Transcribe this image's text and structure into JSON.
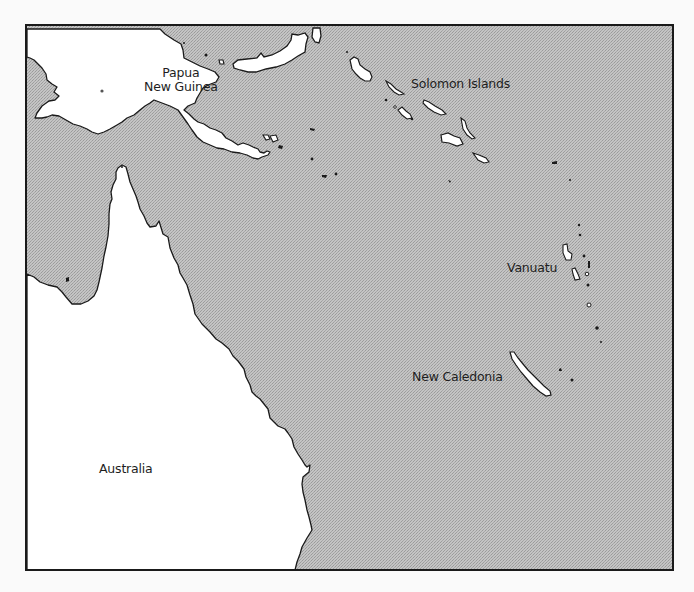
{
  "map": {
    "type": "regional map",
    "colors": {
      "land": "#ffffff",
      "sea": "#bdbdbd",
      "coastline": "#1a1a1a",
      "frame": "#1a1a1a",
      "label": "#1e1e1e"
    },
    "labels": {
      "papua_new_guinea_line1": "Papua",
      "papua_new_guinea_line2": "New Guinea",
      "solomon_islands": "Solomon Islands",
      "vanuatu": "Vanuatu",
      "new_caledonia": "New Caledonia",
      "australia": "Australia"
    }
  }
}
